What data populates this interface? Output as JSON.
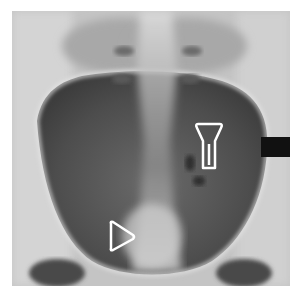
{
  "image": {
    "kind": "radiograph",
    "description": "Pelvic X-ray (AP view) showing the pelvic bowl with a central bright column, two white outline markers, and a black rectangle on the right edge",
    "markers": [
      {
        "name": "lamp-shaped-marker",
        "shape": "keyhole/trapezoid outline"
      },
      {
        "name": "triangle-arrowhead-marker",
        "shape": "right-pointing triangle outline"
      }
    ],
    "colors": {
      "background": "#ffffff",
      "bone_light": "#d8d8d8",
      "soft_tissue_dark": "#4a4a4a",
      "marker": "#ffffff",
      "black_block": "#111111"
    }
  }
}
